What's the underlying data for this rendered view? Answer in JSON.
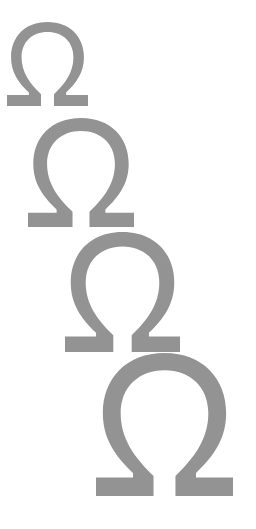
{
  "canvas": {
    "width": 256,
    "height": 529,
    "background": "#ffffff"
  },
  "glyph": {
    "symbol": "Ω",
    "name": "omega",
    "color": "#939393"
  },
  "omegas": [
    {
      "label": "Ω",
      "x": 7,
      "y": 22,
      "w": 81,
      "h": 84
    },
    {
      "label": "Ω",
      "x": 28,
      "y": 118,
      "w": 106,
      "h": 109
    },
    {
      "label": "Ω",
      "x": 65,
      "y": 232,
      "w": 115,
      "h": 120
    },
    {
      "label": "Ω",
      "x": 96,
      "y": 353,
      "w": 137,
      "h": 143
    }
  ]
}
